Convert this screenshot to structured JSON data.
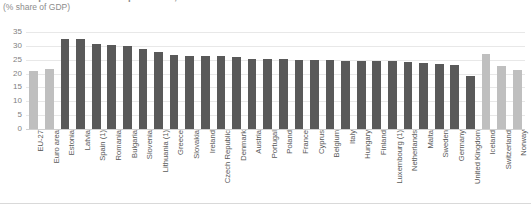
{
  "chart_data": {
    "type": "bar",
    "title": "Total expenditure on social protection, 2016",
    "subtitle": "(% share of GDP)",
    "xlabel": "",
    "ylabel": "",
    "ylim": [
      0,
      35
    ],
    "yticks": [
      0,
      5,
      10,
      15,
      20,
      25,
      30,
      35
    ],
    "grid": true,
    "legend": "none",
    "categories": [
      "EU-27",
      "Euro area",
      "Estonia",
      "Latvia",
      "Spain (1)",
      "Romania",
      "Bulgaria",
      "Slovenia",
      "Lithuania (1)",
      "Greece",
      "Slovakia",
      "Ireland",
      "Czech Republic",
      "Denmark",
      "Austria",
      "Portugal",
      "Poland",
      "France",
      "Cyprus",
      "Belgium",
      "Italy",
      "Hungary",
      "Finland",
      "Luxembourg (1)",
      "Netherlands",
      "Malta",
      "Sweden",
      "Germany",
      "United Kingdom",
      "Iceland",
      "Switzerland",
      "Norway"
    ],
    "values": [
      21.0,
      21.5,
      32.5,
      32.3,
      30.8,
      30.4,
      29.8,
      28.9,
      27.9,
      26.6,
      26.5,
      26.4,
      26.3,
      25.9,
      25.4,
      25.3,
      25.2,
      25.0,
      24.9,
      24.8,
      24.7,
      24.6,
      24.5,
      24.4,
      24.2,
      23.9,
      23.6,
      23.2,
      19.0,
      27.2,
      22.6,
      21.4
    ],
    "series_colors": [
      "#bfbfbf",
      "#bfbfbf",
      "#595959",
      "#595959",
      "#595959",
      "#595959",
      "#595959",
      "#595959",
      "#595959",
      "#595959",
      "#595959",
      "#595959",
      "#595959",
      "#595959",
      "#595959",
      "#595959",
      "#595959",
      "#595959",
      "#595959",
      "#595959",
      "#595959",
      "#595959",
      "#595959",
      "#595959",
      "#595959",
      "#595959",
      "#595959",
      "#595959",
      "#595959",
      "#bfbfbf",
      "#bfbfbf",
      "#bfbfbf"
    ],
    "colors": {
      "aggregate_bar": "#bfbfbf",
      "member_state_bar": "#595959",
      "gridline": "#e8e8e8",
      "axis_text": "#7f7f7f",
      "label_text": "#595959",
      "title_text": "#8c8c8c",
      "background": "#ffffff"
    }
  }
}
